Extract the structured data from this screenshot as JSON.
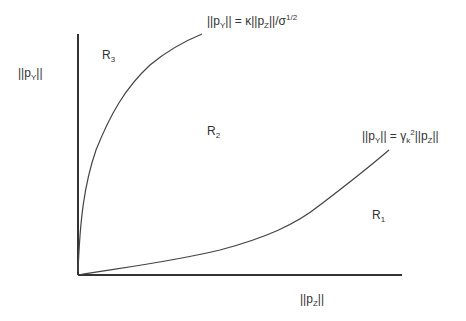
{
  "diagram": {
    "axes": {
      "y_label": {
        "prefix": "||p",
        "sub": "Y",
        "suffix": "||"
      },
      "x_label": {
        "prefix": "||p",
        "sub": "Z",
        "suffix": "||"
      },
      "color": "#333333"
    },
    "regions": [
      {
        "id": "R1",
        "letter": "R",
        "sub": "1"
      },
      {
        "id": "R2",
        "letter": "R",
        "sub": "2"
      },
      {
        "id": "R3",
        "letter": "R",
        "sub": "3"
      }
    ],
    "curves": [
      {
        "id": "upper-boundary",
        "equation": {
          "lhs": "||p",
          "lhs_sub": "Y",
          "mid": "|| = κ||p",
          "mid_sub": "Z",
          "rhs": "||/σ",
          "rhs_sup": "1/2"
        }
      },
      {
        "id": "lower-boundary",
        "equation": {
          "lhs": "||p",
          "lhs_sub": "Y",
          "mid": "|| = γ",
          "mid_sub": "k",
          "mid_sup": "2",
          "rhs": "||p",
          "rhs_sub": "Z",
          "tail": "||"
        }
      }
    ]
  }
}
